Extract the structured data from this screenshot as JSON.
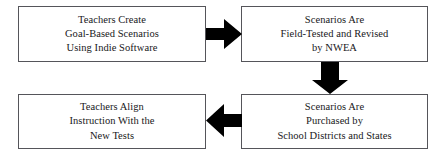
{
  "diagram": {
    "type": "flowchart",
    "background_color": "#ffffff",
    "box_border_color": "#55555a",
    "arrow_color": "#000000",
    "text_color": "#18181a",
    "boxes": [
      {
        "id": "create",
        "text": "Teachers Create\nGoal-Based Scenarios\nUsing Indie Software",
        "position": "top-left"
      },
      {
        "id": "field-tested",
        "text": "Scenarios Are\nField-Tested and Revised\nby NWEA",
        "position": "top-right"
      },
      {
        "id": "align",
        "text": "Teachers Align\nInstruction With the\nNew Tests",
        "position": "bottom-left"
      },
      {
        "id": "purchased",
        "text": "Scenarios Are\nPurchased by\nSchool Districts and States",
        "position": "bottom-right"
      }
    ],
    "arrows": [
      {
        "id": "right",
        "direction": "right",
        "from": "create",
        "to": "field-tested"
      },
      {
        "id": "down",
        "direction": "down",
        "from": "field-tested",
        "to": "purchased"
      },
      {
        "id": "left",
        "direction": "left",
        "from": "purchased",
        "to": "align"
      }
    ]
  }
}
